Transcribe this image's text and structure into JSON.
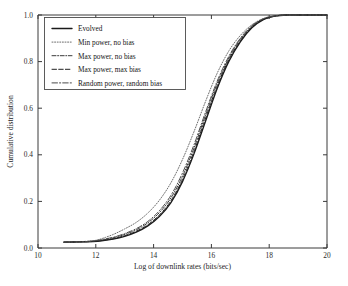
{
  "chart_data": {
    "type": "line",
    "title": "",
    "xlabel": "Log of downlink rates (bits/sec)",
    "ylabel": "Cumulative distribution",
    "xlim": [
      10,
      20
    ],
    "ylim": [
      0.0,
      1.0
    ],
    "xticks": [
      "10",
      "12",
      "14",
      "16",
      "18",
      "20"
    ],
    "yticks": [
      "0.0",
      "0.2",
      "0.4",
      "0.6",
      "0.8",
      "1.0"
    ],
    "grid": false,
    "legend_position": "upper left",
    "x": [
      10.9,
      11.4,
      11.9,
      12.2,
      12.6,
      13.0,
      13.4,
      13.8,
      14.2,
      14.6,
      15.0,
      15.4,
      15.8,
      16.2,
      16.6,
      17.0,
      17.4,
      17.8,
      18.2,
      18.6,
      19.2,
      20.0
    ],
    "series": [
      {
        "name": "Evolved",
        "style": "solid",
        "color": "#1a1a1a",
        "values": [
          0.025,
          0.026,
          0.028,
          0.031,
          0.038,
          0.05,
          0.068,
          0.095,
          0.135,
          0.195,
          0.285,
          0.405,
          0.545,
          0.685,
          0.8,
          0.885,
          0.945,
          0.98,
          0.995,
          1.0,
          1.0,
          1.0
        ]
      },
      {
        "name": "Min power, no bias",
        "style": "dotted",
        "color": "#6e6e6e",
        "values": [
          0.025,
          0.027,
          0.031,
          0.04,
          0.058,
          0.082,
          0.11,
          0.15,
          0.205,
          0.28,
          0.38,
          0.5,
          0.63,
          0.75,
          0.845,
          0.912,
          0.958,
          0.985,
          0.997,
          1.0,
          1.0,
          1.0
        ]
      },
      {
        "name": "Max power, no bias",
        "style": "dashdot",
        "color": "#3a3a3a",
        "values": [
          0.025,
          0.026,
          0.029,
          0.034,
          0.044,
          0.058,
          0.078,
          0.108,
          0.152,
          0.215,
          0.308,
          0.43,
          0.572,
          0.706,
          0.815,
          0.896,
          0.951,
          0.983,
          0.996,
          1.0,
          1.0,
          1.0
        ]
      },
      {
        "name": "Max power, max bias",
        "style": "dashed",
        "color": "#222222",
        "values": [
          0.025,
          0.026,
          0.028,
          0.032,
          0.04,
          0.053,
          0.072,
          0.1,
          0.142,
          0.203,
          0.295,
          0.416,
          0.558,
          0.695,
          0.808,
          0.89,
          0.948,
          0.981,
          0.995,
          1.0,
          1.0,
          1.0
        ]
      },
      {
        "name": "Random power, random bias",
        "style": "dashdot-long",
        "color": "#4a4a4a",
        "values": [
          0.025,
          0.026,
          0.03,
          0.036,
          0.046,
          0.062,
          0.083,
          0.114,
          0.16,
          0.226,
          0.322,
          0.444,
          0.584,
          0.716,
          0.822,
          0.9,
          0.954,
          0.984,
          0.996,
          1.0,
          1.0,
          1.0
        ]
      }
    ]
  }
}
